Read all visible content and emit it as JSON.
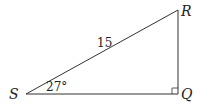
{
  "diagram": {
    "type": "right-triangle",
    "vertices": {
      "S": {
        "label": "S"
      },
      "Q": {
        "label": "Q"
      },
      "R": {
        "label": "R"
      }
    },
    "hypotenuse_label": "15",
    "angle_label": "27°",
    "right_angle_at": "Q",
    "line_color": "#333333"
  }
}
